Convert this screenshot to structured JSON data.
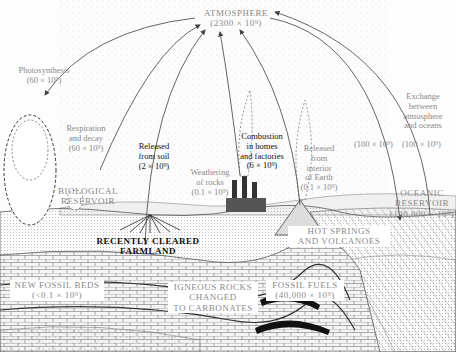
{
  "reservoirs": {
    "atmosphere": {
      "name": "ATMOSPHERE",
      "amount": "(2300 × 10⁹)"
    },
    "biological": {
      "name": "BIOLOGICAL",
      "name2": "RESERVOIR"
    },
    "oceanic": {
      "name": "OCEANIC",
      "name2": "RESERVOIR",
      "amount": "(130,000 × 10⁹)"
    },
    "farmland": {
      "name": "RECENTLY CLEARED",
      "name2": "FARMLAND"
    },
    "hot_springs": {
      "name": "HOT SPRINGS",
      "name2": "AND VOLCANOES"
    },
    "new_fossil": {
      "name": "NEW FOSSIL BEDS",
      "amount": "(<0.1 × 10⁹)"
    },
    "igneous": {
      "name": "IGNEOUS ROCKS",
      "name2": "CHANGED",
      "name3": "TO CARBONATES"
    },
    "fossil_fuels": {
      "name": "FOSSIL FUELS",
      "amount": "(40,000 × 10⁹)"
    }
  },
  "fluxes": {
    "photosynthesis": {
      "line1": "Photosynthesis",
      "amount": "(60 × 10⁹)"
    },
    "respiration": {
      "line1": "Respiration",
      "line2": "and decay",
      "amount": "(60 × 10⁹)"
    },
    "soil": {
      "line1": "Released",
      "line2": "from soil",
      "amount": "(2 × 10⁹)"
    },
    "weathering": {
      "line1": "Weathering",
      "line2": "of rocks",
      "amount": "(0.1 × 10⁹)"
    },
    "combustion": {
      "line1": "Combustion",
      "line2": "in homes",
      "line3": "and factories",
      "amount": "(6 × 10⁹)"
    },
    "interior": {
      "line1": "Released",
      "line2": "from",
      "line3": "interior",
      "line4": "of Earth",
      "amount": "(0.1 × 10⁹)"
    },
    "exchange": {
      "line1": "Exchange",
      "line2": "between",
      "line3": "atmosphere",
      "line4": "and oceans",
      "amount_down": "(100 × 10⁹)",
      "amount_up": "(100 × 10⁹)"
    }
  }
}
